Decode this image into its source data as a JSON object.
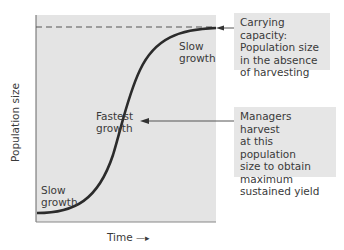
{
  "diagram": {
    "type": "logistic-growth-curve",
    "axes": {
      "y_label": "Population size",
      "x_label": "Time",
      "x_arrow": "—▸"
    },
    "curve_labels": {
      "slow_growth_bottom": [
        "Slow",
        "growth"
      ],
      "fastest_growth": [
        "Fastest",
        "growth"
      ],
      "slow_growth_top": [
        "Slow",
        "growth"
      ]
    },
    "callouts": {
      "carrying_capacity": {
        "lines": [
          "Carrying capacity:",
          "Population size",
          "in the absence",
          "of harvesting"
        ]
      },
      "harvest": {
        "lines": [
          "Managers harvest",
          "at this population",
          "size to obtain",
          "maximum",
          "sustained yield"
        ]
      }
    },
    "colors": {
      "plot_background": "#e4e4e4",
      "callout_background": "#e6e6e6",
      "curve": "#2b2b2b",
      "axis": "#555555",
      "text": "#3a3a3a"
    }
  }
}
